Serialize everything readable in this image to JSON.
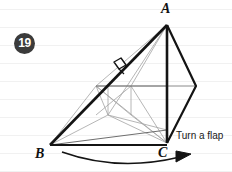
{
  "page": {
    "width": 232,
    "height": 172,
    "background_color": "#ffffff",
    "ruled_line_color": "#f0f0f0",
    "ruled_line_spacing": 18
  },
  "step": {
    "number": "19",
    "badge_fill": "#3b3b3b",
    "badge_text_color": "#ffffff"
  },
  "figure": {
    "type": "origami-fold-diagram",
    "stroke_color_heavy": "#111111",
    "stroke_color_light": "#9a9a9a",
    "vertices": {
      "A": {
        "label": "A",
        "x": 167,
        "y": 25
      },
      "B": {
        "label": "B",
        "x": 50,
        "y": 145
      },
      "C": {
        "label": "C",
        "x": 167,
        "y": 143
      },
      "D": {
        "label": "",
        "x": 196,
        "y": 86
      }
    }
  },
  "annotations": {
    "turn_a_flap": "Turn a flap"
  }
}
